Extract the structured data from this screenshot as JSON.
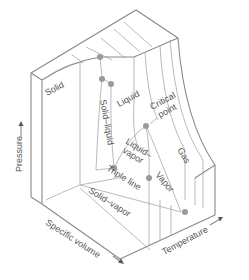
{
  "diagram": {
    "axes": {
      "pressure": "Pressure",
      "specific_volume": "Specific volume",
      "temperature": "Temperature"
    },
    "regions": {
      "solid": "Solid",
      "solid_liquid": "Solid–liquid",
      "liquid": "Liquid",
      "liquid_vapor_line1": "Liquid–",
      "liquid_vapor_line2": "vapor",
      "vapor": "Vapor",
      "gas": "Gas",
      "solid_vapor": "Solid–vapor"
    },
    "annotations": {
      "critical_point_line1": "Critical",
      "critical_point_line2": "point",
      "triple_line": "Triple line"
    },
    "colors": {
      "edge": "#8a8a8a",
      "dot": "#9a9a9a",
      "text": "#555555"
    }
  }
}
